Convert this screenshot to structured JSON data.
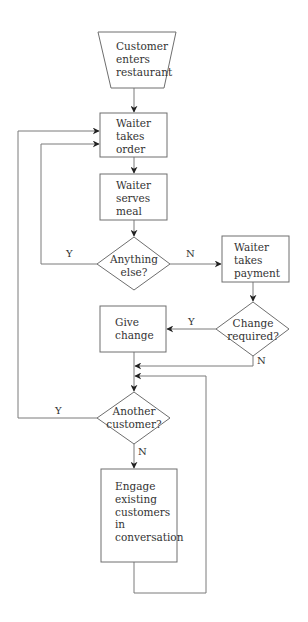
{
  "diagram": {
    "type": "flowchart",
    "nodes": [
      {
        "id": "start",
        "shape": "trapezoid",
        "lines": [
          "Customer",
          "enters",
          "restaurant"
        ]
      },
      {
        "id": "take_order",
        "shape": "process",
        "lines": [
          "Waiter",
          "takes",
          "order"
        ]
      },
      {
        "id": "serve_meal",
        "shape": "process",
        "lines": [
          "Waiter",
          "serves",
          "meal"
        ]
      },
      {
        "id": "anything_else",
        "shape": "decision",
        "lines": [
          "Anything",
          "else?"
        ]
      },
      {
        "id": "take_payment",
        "shape": "process",
        "lines": [
          "Waiter",
          "takes",
          "payment"
        ]
      },
      {
        "id": "change_required",
        "shape": "decision",
        "lines": [
          "Change",
          "required?"
        ]
      },
      {
        "id": "give_change",
        "shape": "process",
        "lines": [
          "Give",
          "change"
        ]
      },
      {
        "id": "another_customer",
        "shape": "decision",
        "lines": [
          "Another",
          "customer?"
        ]
      },
      {
        "id": "engage",
        "shape": "process",
        "lines": [
          "Engage",
          "existing",
          "customers",
          "in",
          "conversation"
        ]
      }
    ],
    "edge_labels": {
      "anything_else_yes": "Y",
      "anything_else_no": "N",
      "change_required_yes": "Y",
      "change_required_no": "N",
      "another_customer_yes": "Y",
      "another_customer_no": "N"
    },
    "edges": [
      {
        "from": "start",
        "to": "take_order"
      },
      {
        "from": "take_order",
        "to": "serve_meal"
      },
      {
        "from": "serve_meal",
        "to": "anything_else"
      },
      {
        "from": "anything_else",
        "to": "take_order",
        "label": "Y"
      },
      {
        "from": "anything_else",
        "to": "take_payment",
        "label": "N"
      },
      {
        "from": "take_payment",
        "to": "change_required"
      },
      {
        "from": "change_required",
        "to": "give_change",
        "label": "Y"
      },
      {
        "from": "change_required",
        "to": "another_customer",
        "label": "N"
      },
      {
        "from": "give_change",
        "to": "another_customer"
      },
      {
        "from": "another_customer",
        "to": "take_order",
        "label": "Y"
      },
      {
        "from": "another_customer",
        "to": "engage",
        "label": "N"
      },
      {
        "from": "engage",
        "to": "another_customer"
      }
    ]
  }
}
